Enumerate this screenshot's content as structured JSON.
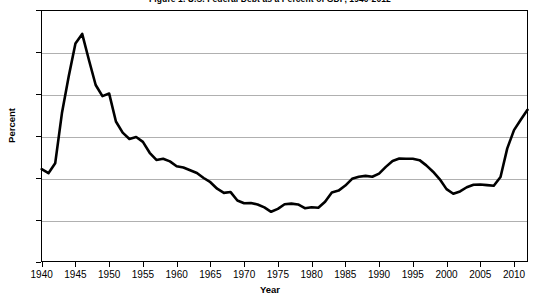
{
  "chart_data": {
    "type": "line",
    "title": "Figure 1. U.S. Federal Debt as a Percent of GDP, 1940-2012",
    "xlabel": "Year",
    "ylabel": "Percent",
    "xlim": [
      1940,
      2012
    ],
    "ylim": [
      0,
      120
    ],
    "grid": true,
    "legend": "none",
    "line_color": "#000000",
    "grid_color": "#b0b0b0",
    "axis_color": "#000000",
    "background": "#ffffff",
    "xticks": [
      1940,
      1945,
      1950,
      1955,
      1960,
      1965,
      1970,
      1975,
      1980,
      1985,
      1990,
      1995,
      2000,
      2005,
      2010
    ],
    "yticks": [
      0,
      20,
      40,
      60,
      80,
      100,
      120
    ],
    "series": [
      {
        "name": "Federal debt as percent of GDP",
        "x": [
          1940,
          1941,
          1942,
          1943,
          1944,
          1945,
          1946,
          1947,
          1948,
          1949,
          1950,
          1951,
          1952,
          1953,
          1954,
          1955,
          1956,
          1957,
          1958,
          1959,
          1960,
          1961,
          1962,
          1963,
          1964,
          1965,
          1966,
          1967,
          1968,
          1969,
          1970,
          1971,
          1972,
          1973,
          1974,
          1975,
          1976,
          1977,
          1978,
          1979,
          1980,
          1981,
          1982,
          1983,
          1984,
          1985,
          1986,
          1987,
          1988,
          1989,
          1990,
          1991,
          1992,
          1993,
          1994,
          1995,
          1996,
          1997,
          1998,
          1999,
          2000,
          2001,
          2002,
          2003,
          2004,
          2005,
          2006,
          2007,
          2008,
          2009,
          2010,
          2011,
          2012
        ],
        "values": [
          44.2,
          42.3,
          47.0,
          70.9,
          88.3,
          104.0,
          108.6,
          96.2,
          84.3,
          79.0,
          80.2,
          66.9,
          61.6,
          58.6,
          59.5,
          57.2,
          52.0,
          48.6,
          49.2,
          47.9,
          45.6,
          45.0,
          43.7,
          42.4,
          40.0,
          38.0,
          34.9,
          32.9,
          33.3,
          29.3,
          28.0,
          28.1,
          27.4,
          26.0,
          23.9,
          25.3,
          27.5,
          27.8,
          27.4,
          25.6,
          26.1,
          25.8,
          28.7,
          33.1,
          34.0,
          36.4,
          39.6,
          40.6,
          41.0,
          40.6,
          42.1,
          45.3,
          48.1,
          49.3,
          49.2,
          49.2,
          48.5,
          46.0,
          43.0,
          39.4,
          34.7,
          32.5,
          33.6,
          35.6,
          36.8,
          36.9,
          36.6,
          36.3,
          40.5,
          54.1,
          62.8,
          67.7,
          72.5
        ]
      }
    ]
  }
}
